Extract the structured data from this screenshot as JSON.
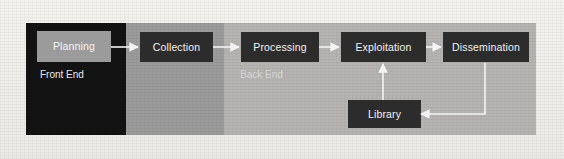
{
  "diagram": {
    "background_color": "#f0eeea",
    "bands": [
      {
        "name": "front-end-band",
        "label": "Front End",
        "color": "#131313",
        "text_color": "#e9e9e9"
      },
      {
        "name": "collection-band",
        "label": "",
        "color": "#9b9b9b",
        "text_color": "#f4f4f4"
      },
      {
        "name": "back-end-band",
        "label": "Back End",
        "color": "#b5b4b2",
        "text_color": "#d7d6d4"
      }
    ],
    "captions": {
      "front_end": "Front End",
      "back_end": "Back End"
    },
    "node_fill": "#2c2c2c",
    "node_fill_alt": "#9b9b9b",
    "node_text_color": "#f2f2f2",
    "connector_color": "#f4f4f4",
    "nodes": [
      {
        "id": "planning",
        "label": "Planning",
        "style": "light"
      },
      {
        "id": "collection",
        "label": "Collection",
        "style": "dark"
      },
      {
        "id": "processing",
        "label": "Processing",
        "style": "dark"
      },
      {
        "id": "exploitation",
        "label": "Exploitation",
        "style": "dark"
      },
      {
        "id": "dissemination",
        "label": "Dissemination",
        "style": "dark"
      },
      {
        "id": "library",
        "label": "Library",
        "style": "dark"
      }
    ],
    "flow": [
      {
        "from": "planning",
        "to": "collection"
      },
      {
        "from": "collection",
        "to": "processing"
      },
      {
        "from": "processing",
        "to": "exploitation"
      },
      {
        "from": "exploitation",
        "to": "dissemination"
      },
      {
        "from": "dissemination",
        "to": "library"
      },
      {
        "from": "library",
        "to": "exploitation"
      }
    ]
  }
}
